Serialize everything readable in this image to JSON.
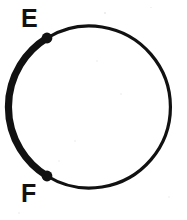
{
  "figure": {
    "kind": "geometry-diagram",
    "background_color": "#ffffff",
    "ink_color": "#111111",
    "canvas": {
      "width": 187,
      "height": 220
    },
    "circle": {
      "name": "circle",
      "center": {
        "x": 91,
        "y": 108
      },
      "radius": 81,
      "thin_stroke_width": 3,
      "bold_stroke_width": 7
    },
    "points": [
      {
        "id": "E",
        "label": "E",
        "marker": "filled-dot",
        "marker_radius": 5,
        "position": {
          "x": 47,
          "y": 38
        },
        "label_position": {
          "x": 21,
          "y": 6
        },
        "angle_deg": 213
      },
      {
        "id": "F",
        "label": "F",
        "marker": "filled-dot",
        "marker_radius": 5,
        "position": {
          "x": 47,
          "y": 176
        },
        "label_position": {
          "x": 21,
          "y": 181
        },
        "angle_deg": 147
      }
    ],
    "arcs": [
      {
        "id": "arc-EF-bold",
        "name": "highlighted-minor-arc",
        "endpoints": [
          "E",
          "F"
        ],
        "side": "left",
        "emphasis": "bold",
        "stroke_width": 7,
        "sweep": "counterclockwise-from-E-to-F",
        "sweep_deg": 134
      },
      {
        "id": "arc-EF-thin",
        "name": "remaining-major-arc",
        "endpoints": [
          "E",
          "F"
        ],
        "side": "right",
        "emphasis": "thin",
        "stroke_width": 3,
        "sweep": "clockwise-from-E-over-top-to-F",
        "sweep_deg": 226
      }
    ],
    "labels": {
      "e": "E",
      "f": "F"
    }
  }
}
